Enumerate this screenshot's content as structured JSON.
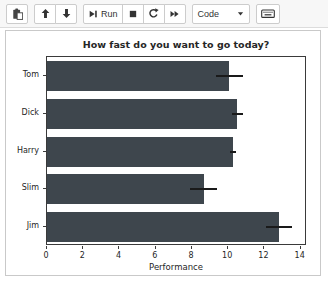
{
  "toolbar": {
    "buttons": {
      "paste": {
        "icon": "clipboard-icon"
      },
      "move_up": {
        "icon": "arrow-up-icon"
      },
      "move_down": {
        "icon": "arrow-down-icon"
      },
      "run": {
        "icon": "step-forward-icon",
        "label": "Run"
      },
      "stop": {
        "icon": "stop-icon"
      },
      "restart": {
        "icon": "restart-icon"
      },
      "restart_run_all": {
        "icon": "fast-forward-icon"
      }
    },
    "cell_type_select": {
      "value": "Code",
      "icon": "caret-down-icon"
    },
    "command_palette": {
      "icon": "keyboard-icon"
    }
  },
  "chart_data": {
    "type": "bar",
    "orientation": "horizontal",
    "title": "How fast do you want to go today?",
    "xlabel": "Performance",
    "ylabel": "",
    "categories": [
      "Tom",
      "Dick",
      "Harry",
      "Slim",
      "Jim"
    ],
    "values": [
      10.05,
      10.5,
      10.25,
      8.65,
      12.8
    ],
    "errors": [
      0.75,
      0.3,
      0.17,
      0.75,
      0.7
    ],
    "xlim": [
      0,
      14.35
    ],
    "xticks": [
      0,
      2,
      4,
      6,
      8,
      10,
      12,
      14
    ],
    "grid": false,
    "legend": false,
    "first_category_position": "top",
    "bar_color": "#3e464d",
    "error_color": "#1a1a1a"
  }
}
